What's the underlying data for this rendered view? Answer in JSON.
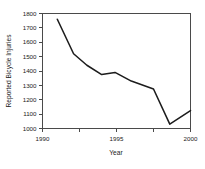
{
  "chart_data": {
    "type": "line",
    "title": "",
    "xlabel": "Year",
    "ylabel": "Reported Bicycle Injuries",
    "xlim": [
      1990,
      2000
    ],
    "ylim": [
      1000,
      1800
    ],
    "grid": false,
    "legend": false,
    "x_ticks": [
      1990,
      1992.5,
      1995,
      1997.5,
      2000
    ],
    "x_tick_labels": [
      "1990",
      "",
      "1995",
      "",
      "2000"
    ],
    "y_ticks": [
      1000,
      1100,
      1200,
      1300,
      1400,
      1500,
      1600,
      1700,
      1800
    ],
    "y_tick_labels": [
      "1000",
      "1100",
      "1200",
      "1300",
      "1400",
      "1500",
      "1600",
      "1700",
      "1800"
    ],
    "series": [
      {
        "name": "Reported Bicycle Injuries",
        "color": "#1c1c1c",
        "x": [
          1991.0,
          1992.1,
          1993.0,
          1994.0,
          1994.9,
          1996.0,
          1997.5,
          1998.6,
          2000.0
        ],
        "values": [
          1760,
          1520,
          1440,
          1375,
          1390,
          1330,
          1275,
          1030,
          1125
        ]
      }
    ]
  },
  "axes": {
    "ylabel": "Reported Bicycle Injuries",
    "xlabel": "Year"
  }
}
